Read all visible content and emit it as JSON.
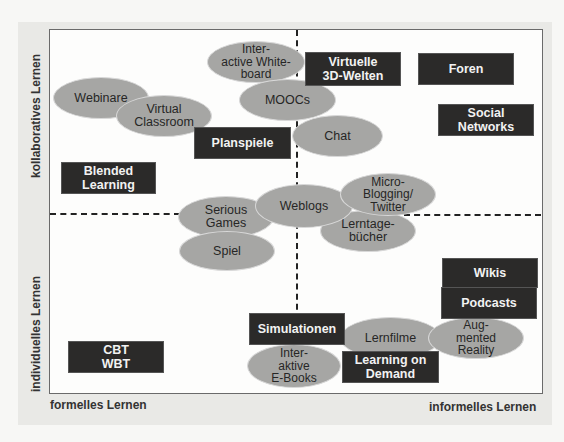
{
  "axes": {
    "y_top": "kollaboratives Lernen",
    "y_bottom": "individuelles Lernen",
    "x_left": "formelles Lernen",
    "x_right": "informelles Lernen"
  },
  "colors": {
    "box_fill": "#2b2a29",
    "box_text": "#f2f2f2",
    "ellipse_fill": "#a6a6a4",
    "ellipse_text": "#262626",
    "panel_bg": "#e9e9e6",
    "chart_bg": "#fdfdfc"
  },
  "boxes": {
    "virtuelle_3d": "Virtuelle\n3D-Welten",
    "foren": "Foren",
    "social_networks": "Social\nNetworks",
    "planspiele": "Planspiele",
    "blended_learning": "Blended\nLearning",
    "wikis": "Wikis",
    "podcasts": "Podcasts",
    "simulationen": "Simulationen",
    "learning_on_demand": "Learning on\nDemand",
    "cbt_wbt": "CBT\nWBT"
  },
  "ellipses": {
    "interactive_whiteboard": "Inter-\nactive White-\nboard",
    "webinare": "Webinare",
    "virtual_classroom": "Virtual\nClassroom",
    "moocs": "MOOCs",
    "chat": "Chat",
    "micro_blogging": "Micro-\nBlogging/\nTwitter",
    "weblogs": "Weblogs",
    "serious_games": "Serious\nGames",
    "lerntagebuecher": "Lerntage-\nbücher",
    "spiel": "Spiel",
    "lernfilme": "Lernfilme",
    "augmented_reality": "Aug-\nmented\nReality",
    "interaktive_ebooks": "Inter-\naktive\nE-Books"
  }
}
